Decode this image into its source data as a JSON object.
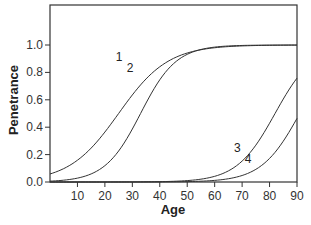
{
  "chart_data": {
    "type": "line",
    "title": "",
    "xlabel": "Age",
    "ylabel": "Penetrance",
    "xlim": [
      0,
      90
    ],
    "ylim": [
      0,
      1.3
    ],
    "grid": false,
    "legend": "none (curves labeled inline 1–4)",
    "x_ticks": [
      10,
      20,
      30,
      40,
      50,
      60,
      70,
      80,
      90
    ],
    "y_ticks": [
      0.0,
      0.2,
      0.4,
      0.6,
      0.8,
      1.0
    ],
    "x_tick_labels": [
      "10",
      "20",
      "30",
      "40",
      "50",
      "60",
      "70",
      "80",
      "90"
    ],
    "y_tick_labels": [
      "0.0",
      "0.2",
      "0.4",
      "0.6",
      "0.8",
      "1.0"
    ],
    "x": [
      0,
      10,
      20,
      30,
      40,
      50,
      60,
      70,
      80,
      90
    ],
    "series": [
      {
        "name": "1",
        "values": [
          0.06,
          0.16,
          0.36,
          0.64,
          0.84,
          0.94,
          0.98,
          0.99,
          1.0,
          1.0
        ],
        "label_pos": [
          24,
          0.88
        ]
      },
      {
        "name": "2",
        "values": [
          0.01,
          0.04,
          0.14,
          0.4,
          0.73,
          0.92,
          0.98,
          0.99,
          1.0,
          1.0
        ],
        "label_pos": [
          28,
          0.8
        ]
      },
      {
        "name": "3",
        "values": [
          0.0,
          0.0,
          0.0,
          0.0,
          0.0,
          0.01,
          0.04,
          0.13,
          0.4,
          0.75
        ],
        "label_pos": [
          67,
          0.22
        ]
      },
      {
        "name": "4",
        "values": [
          0.0,
          0.0,
          0.0,
          0.0,
          0.0,
          0.0,
          0.01,
          0.05,
          0.17,
          0.46
        ],
        "label_pos": [
          71,
          0.14
        ]
      }
    ],
    "model": [
      {
        "name": "1",
        "midpoint": 25,
        "scale": 9
      },
      {
        "name": "2",
        "midpoint": 33,
        "scale": 6.5
      },
      {
        "name": "3",
        "midpoint": 82,
        "scale": 7
      },
      {
        "name": "4",
        "midpoint": 91,
        "scale": 7
      }
    ]
  },
  "colors": {
    "axis": "#333333",
    "curve": "#333333",
    "background": "#ffffff"
  }
}
